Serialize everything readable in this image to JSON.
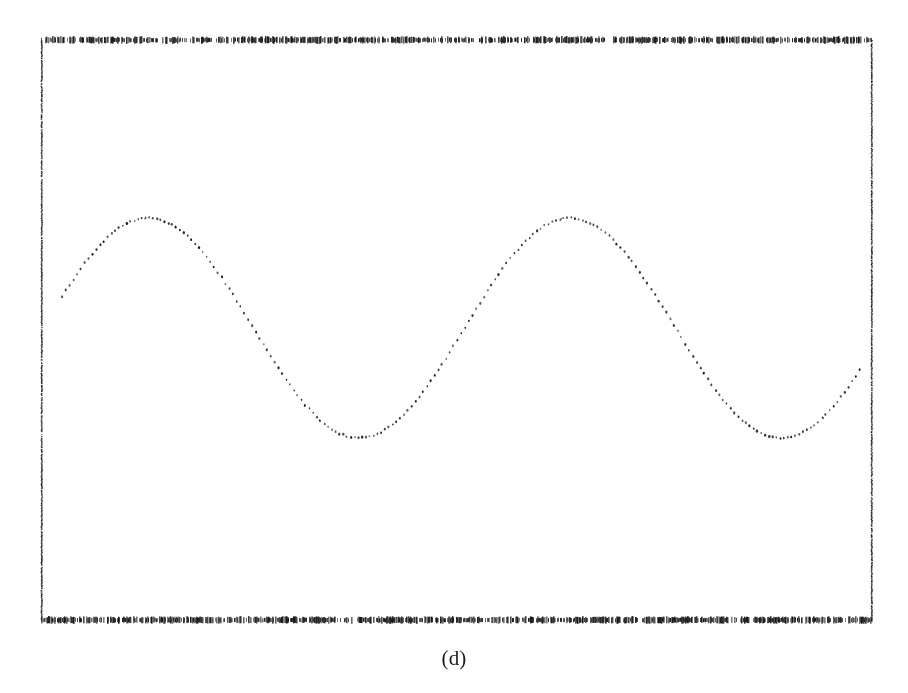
{
  "figure": {
    "caption": "(d)",
    "background_color": "#ffffff",
    "ink_color": "#181818"
  },
  "frame": {
    "left": 41,
    "right": 871,
    "top": 40,
    "bottom": 620,
    "top_border_style": "dotted",
    "bottom_border_style": "dotted",
    "left_border_style": "solid",
    "right_border_style": "solid",
    "border_color": "#1a1a1a"
  },
  "chart_data": {
    "type": "scatter",
    "title": "",
    "subtitle": "",
    "xlabel": "",
    "ylabel": "",
    "annotations": [
      "(d)"
    ],
    "legend": [],
    "legend_position": "none",
    "grid": false,
    "axis_ticks_visible": false,
    "tick_labels_x": [],
    "tick_labels_y": [],
    "xlim": [
      0,
      830
    ],
    "ylim": [
      0,
      580
    ],
    "marker": "dot",
    "marker_size_px": 2.2,
    "marker_color": "#181818",
    "series": [
      {
        "name": "sampled sinusoid",
        "description": "Dotted sinusoidal waveform spanning approximately two full cycles across the plot frame.",
        "waveform": {
          "function": "sine",
          "amplitude_px": 110,
          "midline_y_px": 328,
          "period_px": 422,
          "phase_start_x_px": 62,
          "start_point": [
            62,
            300
          ],
          "end_point": [
            860,
            360
          ],
          "sample_count": 210,
          "sample_spacing_px": 3.8
        },
        "extrema": [
          {
            "kind": "peak",
            "x": 148,
            "y": 218
          },
          {
            "kind": "trough",
            "x": 361,
            "y": 437
          },
          {
            "kind": "peak",
            "x": 570,
            "y": 218
          },
          {
            "kind": "trough",
            "x": 776,
            "y": 438
          }
        ],
        "x": [
          62,
          81,
          100,
          119,
          138,
          157,
          176,
          195,
          214,
          233,
          252,
          271,
          290,
          309,
          328,
          347,
          366,
          385,
          404,
          423,
          442,
          461,
          480,
          499,
          518,
          537,
          556,
          575,
          594,
          613,
          632,
          651,
          670,
          689,
          708,
          727,
          746,
          765,
          784,
          803,
          822,
          841,
          860
        ],
        "y": [
          300,
          258,
          229,
          219,
          219,
          233,
          259,
          292,
          327,
          362,
          393,
          417,
          432,
          437,
          432,
          417,
          393,
          362,
          327,
          292,
          259,
          233,
          220,
          218,
          228,
          252,
          285,
          320,
          356,
          390,
          415,
          432,
          438,
          434,
          420,
          397,
          367,
          333,
          298,
          346,
          322,
          387,
          360
        ]
      }
    ]
  }
}
